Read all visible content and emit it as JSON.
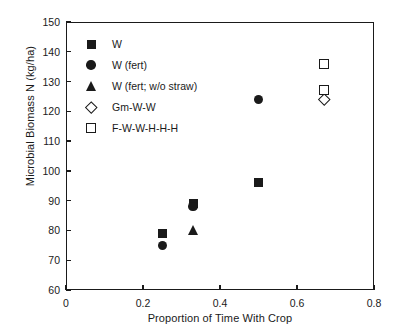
{
  "chart_data": {
    "type": "scatter",
    "title": "",
    "xlabel": "Proportion of Time With Crop",
    "ylabel": "Microbial Biomass N (kg/ha)",
    "xlim": [
      0,
      0.8
    ],
    "ylim": [
      60,
      150
    ],
    "xticks": [
      "0",
      "0.2",
      "0.4",
      "0.6",
      "0.8"
    ],
    "xtick_values": [
      0,
      0.2,
      0.4,
      0.6,
      0.8
    ],
    "yticks": [
      "60",
      "70",
      "80",
      "90",
      "100",
      "110",
      "120",
      "130",
      "140",
      "150"
    ],
    "ytick_values": [
      60,
      70,
      80,
      90,
      100,
      110,
      120,
      130,
      140,
      150
    ],
    "grid": false,
    "legend_position": "upper-left-inside",
    "series": [
      {
        "name": "W",
        "marker": "filled-square",
        "points": [
          {
            "x": 0.25,
            "y": 79
          },
          {
            "x": 0.33,
            "y": 89
          },
          {
            "x": 0.5,
            "y": 96
          }
        ]
      },
      {
        "name": "W (fert)",
        "marker": "filled-circle",
        "points": [
          {
            "x": 0.25,
            "y": 75
          },
          {
            "x": 0.33,
            "y": 88
          },
          {
            "x": 0.5,
            "y": 124
          }
        ]
      },
      {
        "name": "W (fert; w/o straw)",
        "marker": "filled-triangle",
        "points": [
          {
            "x": 0.33,
            "y": 80
          }
        ]
      },
      {
        "name": "Gm-W-W",
        "marker": "open-diamond",
        "points": [
          {
            "x": 0.67,
            "y": 124
          }
        ]
      },
      {
        "name": "F-W-W-H-H-H",
        "marker": "open-square",
        "points": [
          {
            "x": 0.67,
            "y": 136
          },
          {
            "x": 0.67,
            "y": 127
          }
        ]
      }
    ]
  }
}
